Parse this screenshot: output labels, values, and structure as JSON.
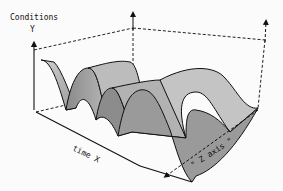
{
  "labels": {
    "y_axis_title": "Conditions",
    "y_axis_letter": "Y",
    "x_axis": "time X",
    "z_axis": "\" Z axis \""
  },
  "colors": {
    "background": "#fbfbfb",
    "surface_light": "#c9c9c9",
    "surface_mid": "#a8a8a8",
    "surface_dark": "#7f7f7f",
    "ink": "#111111"
  }
}
